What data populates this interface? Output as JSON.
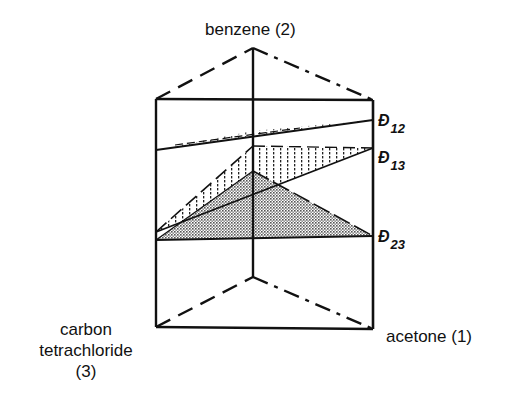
{
  "figure": {
    "type": "ternary-prism-diagram",
    "vertices": {
      "top": {
        "label": "benzene (2)",
        "component": "benzene",
        "index": "2"
      },
      "right": {
        "label": "acetone (1)",
        "component": "acetone",
        "index": "1"
      },
      "left": {
        "label_line1": "carbon",
        "label_line2": "tetrachloride",
        "label_line3": "(3)",
        "component": "carbon tetrachloride",
        "index": "3"
      }
    },
    "planes": [
      {
        "id": "D12",
        "symbol": "Đ",
        "subscript": "12",
        "fill": "sparse-hatch"
      },
      {
        "id": "D13",
        "symbol": "Đ",
        "subscript": "13",
        "fill": "vertical-hatch"
      },
      {
        "id": "D23",
        "symbol": "Đ",
        "subscript": "23",
        "fill": "dotted-gray"
      }
    ],
    "colors": {
      "line": "#111111",
      "shade": "#b8b8b8",
      "background": "#ffffff"
    }
  }
}
